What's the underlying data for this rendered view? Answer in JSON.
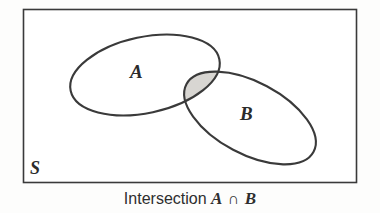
{
  "figure": {
    "kind": "venn-diagram",
    "background_color": "#fdfdfc"
  },
  "universal_set": {
    "label": "S",
    "shape": "rectangle",
    "stroke_color": "#3a3a3a"
  },
  "sets": [
    {
      "name": "set-a",
      "label": "A",
      "shape": "ellipse",
      "stroke_color": "#3a3a3a",
      "fill_color": "#ffffff"
    },
    {
      "name": "set-b",
      "label": "B",
      "shape": "ellipse",
      "stroke_color": "#3a3a3a",
      "fill_color": "#ffffff"
    }
  ],
  "highlight": {
    "name": "intersection-region",
    "fill_color": "#d8d6d2",
    "description": "A ∩ B"
  },
  "caption": {
    "prefix": "Intersection",
    "left_operand": "A",
    "operator": "∩",
    "right_operand": "B",
    "full_text": "Intersection A ∩ B"
  }
}
